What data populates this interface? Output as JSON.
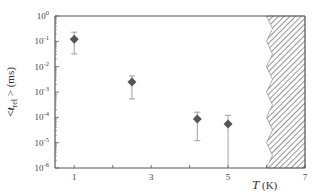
{
  "chart_data": {
    "type": "scatter",
    "title": "",
    "xlabel": "T (K)",
    "xlabel_italic": "T",
    "xlabel_unit": "(K)",
    "ylabel": "<t_rel> (ms)",
    "ylabel_prefix": "<t",
    "ylabel_sub": "rel",
    "ylabel_suffix": "> (ms)",
    "xscale": "linear",
    "yscale": "log",
    "xlim": [
      0.5,
      7
    ],
    "ylim": [
      1e-06,
      1
    ],
    "xticks": [
      1,
      3,
      5,
      7
    ],
    "xtick_labels": [
      "1",
      "3",
      "5",
      "7"
    ],
    "yticks": [
      1,
      0.1,
      0.01,
      0.001,
      0.0001,
      1e-05,
      1e-06
    ],
    "ytick_labels": [
      {
        "base": "10",
        "exp": "0"
      },
      {
        "base": "10",
        "exp": "-1"
      },
      {
        "base": "10",
        "exp": "-2"
      },
      {
        "base": "10",
        "exp": "-3"
      },
      {
        "base": "10",
        "exp": "-4"
      },
      {
        "base": "10",
        "exp": "-5"
      },
      {
        "base": "10",
        "exp": "-6"
      }
    ],
    "grid": false,
    "legend": null,
    "marker": "diamond",
    "series": [
      {
        "name": "<t_rel>",
        "points": [
          {
            "x": 1.0,
            "y": 0.12,
            "err_low": 0.032,
            "err_high": 0.23
          },
          {
            "x": 2.5,
            "y": 0.0025,
            "err_low": 0.00053,
            "err_high": 0.0043
          },
          {
            "x": 4.2,
            "y": 8.6e-05,
            "err_low": 1.2e-05,
            "err_high": 0.00016
          },
          {
            "x": 5.0,
            "y": 5.5e-05,
            "err_low": 1e-06,
            "err_high": 0.00012
          }
        ]
      }
    ],
    "annotations": [
      {
        "type": "hatched_region",
        "x_start": 6.0,
        "x_end": 7.0,
        "edge": "jagged",
        "description": "excluded region"
      }
    ],
    "colors": {
      "marker": "#555555",
      "axis": "#555555",
      "hatch": "#666666"
    }
  }
}
